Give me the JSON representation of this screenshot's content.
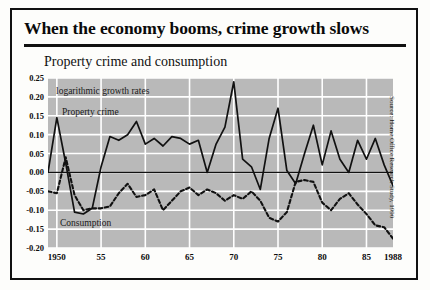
{
  "title": "When the economy booms, crime growth slows",
  "subtitle": "Property crime and consumption",
  "annotations": {
    "log_note": "logarithmic growth rates",
    "series_crime": "Property crime",
    "series_consumption": "Consumption"
  },
  "source": "Source: Home Office Research Study, 1990",
  "colors": {
    "plot_background": "#b9b9b9",
    "gridline": "#ffffff",
    "line": "#111111",
    "frame": "#111111",
    "page": "#fdfdfb"
  },
  "chart_data": {
    "type": "line",
    "title": "Property crime and consumption",
    "subtitle": "logarithmic growth rates",
    "xlabel": "",
    "ylabel": "",
    "xlim": [
      1949,
      1988
    ],
    "ylim": [
      -0.2,
      0.25
    ],
    "yticks": [
      0.25,
      0.2,
      0.15,
      0.1,
      0.05,
      0.0,
      -0.05,
      -0.1,
      -0.15,
      -0.2
    ],
    "ytick_labels": [
      "0.25",
      "0.20",
      "0.15",
      "0.10",
      "0.05",
      "0.00",
      "-0.05",
      "-0.10",
      "-0.15",
      "-0.20"
    ],
    "xticks": [
      1950,
      1955,
      1960,
      1965,
      1970,
      1975,
      1980,
      1985,
      1988
    ],
    "xtick_labels": [
      "1950",
      "55",
      "60",
      "65",
      "70",
      "75",
      "80",
      "85",
      "1988"
    ],
    "grid": true,
    "legend": "inline-annotations",
    "zero_line": 0.0,
    "x": [
      1949,
      1950,
      1951,
      1952,
      1953,
      1954,
      1955,
      1956,
      1957,
      1958,
      1959,
      1960,
      1961,
      1962,
      1963,
      1964,
      1965,
      1966,
      1967,
      1968,
      1969,
      1970,
      1971,
      1972,
      1973,
      1974,
      1975,
      1976,
      1977,
      1978,
      1979,
      1980,
      1981,
      1982,
      1983,
      1984,
      1985,
      1986,
      1987,
      1988
    ],
    "series": [
      {
        "name": "Property crime",
        "style": "solid",
        "values": [
          0.0,
          0.145,
          0.025,
          -0.105,
          -0.11,
          -0.095,
          0.015,
          0.095,
          0.085,
          0.1,
          0.135,
          0.075,
          0.09,
          0.07,
          0.095,
          0.09,
          0.075,
          0.085,
          0.0,
          0.075,
          0.12,
          0.24,
          0.035,
          0.015,
          -0.045,
          0.09,
          0.17,
          0.005,
          -0.03,
          0.05,
          0.125,
          0.02,
          0.11,
          0.035,
          0.0,
          0.085,
          0.035,
          0.09,
          0.02,
          -0.035
        ]
      },
      {
        "name": "Consumption",
        "style": "dashed",
        "values": [
          -0.05,
          -0.055,
          0.04,
          -0.06,
          -0.1,
          -0.095,
          -0.095,
          -0.09,
          -0.055,
          -0.03,
          -0.065,
          -0.06,
          -0.045,
          -0.1,
          -0.075,
          -0.05,
          -0.04,
          -0.06,
          -0.045,
          -0.055,
          -0.075,
          -0.06,
          -0.07,
          -0.05,
          -0.075,
          -0.12,
          -0.13,
          -0.105,
          -0.025,
          -0.02,
          -0.025,
          -0.08,
          -0.1,
          -0.07,
          -0.055,
          -0.085,
          -0.11,
          -0.14,
          -0.145,
          -0.175
        ]
      }
    ]
  }
}
